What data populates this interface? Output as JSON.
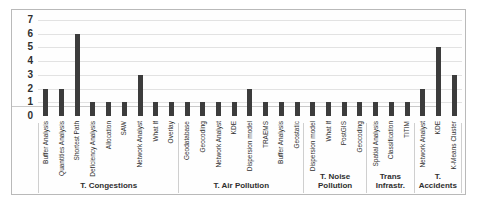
{
  "chart_data": {
    "type": "bar",
    "title": "",
    "xlabel": "",
    "ylabel": "",
    "ylim": [
      0,
      7
    ],
    "yticks": [
      0,
      1,
      2,
      3,
      4,
      5,
      6,
      7
    ],
    "grid": true,
    "legend": null,
    "bar_color": "#3c3c3c",
    "grid_color": "#e2e2e2",
    "categories": [
      "Buffer Analysis",
      "Quantities Analysis",
      "Shortest Path",
      "Deficiency Analysis",
      "Allocation",
      "SAW",
      "Network Analyst",
      "What If",
      "Overlay",
      "Geodatabase",
      "Geocoding",
      "Network Analyst",
      "KDE",
      "Dispersion model",
      "TRAEMS",
      "Buffer Analysis",
      "Geostatic",
      "Dispersion model",
      "What If",
      "PostGIS",
      "Geocoding",
      "Spatial Analysis",
      "Classification",
      "TITIM",
      "Network Analyst",
      "KDE",
      "K-Means Cluster"
    ],
    "values": [
      2,
      2,
      6,
      1,
      1,
      1,
      3,
      1,
      1,
      1,
      1,
      1,
      1,
      2,
      1,
      1,
      1,
      1,
      1,
      1,
      1,
      1,
      1,
      1,
      2,
      5,
      3
    ],
    "groups": [
      {
        "label": "T. Congestions",
        "count": 9
      },
      {
        "label": "T. Air Pollution",
        "count": 8
      },
      {
        "label": "T. Noise\nPollution",
        "count": 4
      },
      {
        "label": "Trans\nInfrastr.",
        "count": 3
      },
      {
        "label": "T.\nAccidents",
        "count": 3
      }
    ]
  }
}
